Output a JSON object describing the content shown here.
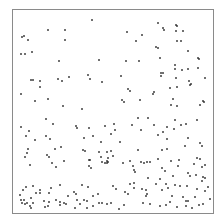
{
  "chart_data": {
    "type": "scatter",
    "title": "",
    "xlabel": "",
    "ylabel": "",
    "grid": false,
    "legend": null,
    "frame": {
      "left": 12,
      "top": 9,
      "right": 213,
      "bottom": 213
    },
    "point_color": "#222222",
    "point_size": 1.6,
    "coordinate_space": "pixel",
    "points": [
      [
        92,
        20
      ],
      [
        48,
        30
      ],
      [
        65,
        30
      ],
      [
        22,
        37
      ],
      [
        24,
        36
      ],
      [
        28,
        40
      ],
      [
        65,
        40
      ],
      [
        21,
        54
      ],
      [
        25,
        54
      ],
      [
        32,
        52
      ],
      [
        59,
        61
      ],
      [
        99,
        60
      ],
      [
        31,
        80
      ],
      [
        33,
        80
      ],
      [
        40,
        81
      ],
      [
        58,
        79
      ],
      [
        62,
        81
      ],
      [
        69,
        77
      ],
      [
        40,
        87
      ],
      [
        88,
        75
      ],
      [
        90,
        79
      ],
      [
        102,
        82
      ],
      [
        21,
        94
      ],
      [
        35,
        101
      ],
      [
        48,
        99
      ],
      [
        63,
        106
      ],
      [
        82,
        109
      ],
      [
        158,
        23
      ],
      [
        163,
        28
      ],
      [
        164,
        30
      ],
      [
        176,
        25
      ],
      [
        177,
        26
      ],
      [
        127,
        32
      ],
      [
        142,
        35
      ],
      [
        176,
        31
      ],
      [
        183,
        31
      ],
      [
        136,
        41
      ],
      [
        177,
        41
      ],
      [
        156,
        47
      ],
      [
        158,
        48
      ],
      [
        181,
        41
      ],
      [
        188,
        51
      ],
      [
        126,
        61
      ],
      [
        139,
        61
      ],
      [
        160,
        58
      ],
      [
        198,
        58
      ],
      [
        199,
        59
      ],
      [
        175,
        65
      ],
      [
        175,
        69
      ],
      [
        182,
        70
      ],
      [
        188,
        69
      ],
      [
        198,
        68
      ],
      [
        161,
        73
      ],
      [
        163,
        73
      ],
      [
        161,
        76
      ],
      [
        121,
        76
      ],
      [
        176,
        78
      ],
      [
        205,
        78
      ],
      [
        189,
        81
      ],
      [
        191,
        84
      ],
      [
        190,
        85
      ],
      [
        170,
        88
      ],
      [
        177,
        87
      ],
      [
        128,
        89
      ],
      [
        130,
        91
      ],
      [
        154,
        92
      ],
      [
        153,
        94
      ],
      [
        122,
        100
      ],
      [
        124,
        102
      ],
      [
        140,
        100
      ],
      [
        173,
        99
      ],
      [
        203,
        101
      ],
      [
        171,
        105
      ],
      [
        177,
        106
      ],
      [
        200,
        105
      ],
      [
        204,
        102
      ],
      [
        46,
        119
      ],
      [
        53,
        124
      ],
      [
        21,
        127
      ],
      [
        29,
        131
      ],
      [
        26,
        136
      ],
      [
        46,
        136
      ],
      [
        50,
        139
      ],
      [
        35,
        140
      ],
      [
        55,
        149
      ],
      [
        61,
        147
      ],
      [
        28,
        149
      ],
      [
        27,
        153
      ],
      [
        47,
        155
      ],
      [
        49,
        157
      ],
      [
        25,
        157
      ],
      [
        64,
        161
      ],
      [
        30,
        165
      ],
      [
        52,
        163
      ],
      [
        56,
        167
      ],
      [
        76,
        126
      ],
      [
        105,
        126
      ],
      [
        115,
        130
      ],
      [
        111,
        134
      ],
      [
        132,
        125
      ],
      [
        138,
        118
      ],
      [
        141,
        130
      ],
      [
        154,
        125
      ],
      [
        148,
        118
      ],
      [
        77,
        128
      ],
      [
        89,
        128
      ],
      [
        114,
        124
      ],
      [
        84,
        138
      ],
      [
        93,
        136
      ],
      [
        101,
        142
      ],
      [
        120,
        142
      ],
      [
        138,
        150
      ],
      [
        158,
        135
      ],
      [
        167,
        127
      ],
      [
        175,
        120
      ],
      [
        181,
        125
      ],
      [
        186,
        124
      ],
      [
        197,
        120
      ],
      [
        174,
        129
      ],
      [
        188,
        138
      ],
      [
        200,
        143
      ],
      [
        163,
        132
      ],
      [
        167,
        139
      ],
      [
        185,
        146
      ],
      [
        202,
        146
      ],
      [
        83,
        150
      ],
      [
        85,
        151
      ],
      [
        99,
        152
      ],
      [
        101,
        157
      ],
      [
        89,
        160
      ],
      [
        90,
        160
      ],
      [
        107,
        152
      ],
      [
        111,
        151
      ],
      [
        113,
        156
      ],
      [
        102,
        162
      ],
      [
        105,
        163
      ],
      [
        107,
        163
      ],
      [
        108,
        158
      ],
      [
        123,
        163
      ],
      [
        108,
        162
      ],
      [
        130,
        161
      ],
      [
        133,
        166
      ],
      [
        141,
        162
      ],
      [
        144,
        163
      ],
      [
        147,
        162
      ],
      [
        150,
        162
      ],
      [
        179,
        160
      ],
      [
        197,
        158
      ],
      [
        162,
        150
      ],
      [
        167,
        149
      ],
      [
        158,
        159
      ],
      [
        171,
        161
      ],
      [
        194,
        164
      ],
      [
        205,
        165
      ],
      [
        200,
        159
      ],
      [
        202,
        167
      ],
      [
        107,
        161
      ],
      [
        89,
        166
      ],
      [
        91,
        168
      ],
      [
        26,
        187
      ],
      [
        23,
        190
      ],
      [
        33,
        186
      ],
      [
        40,
        190
      ],
      [
        36,
        193
      ],
      [
        20,
        195
      ],
      [
        21,
        200
      ],
      [
        24,
        200
      ],
      [
        22,
        203
      ],
      [
        25,
        204
      ],
      [
        27,
        203
      ],
      [
        31,
        198
      ],
      [
        33,
        203
      ],
      [
        40,
        193
      ],
      [
        51,
        188
      ],
      [
        49,
        193
      ],
      [
        56,
        200
      ],
      [
        44,
        201
      ],
      [
        49,
        202
      ],
      [
        30,
        206
      ],
      [
        31,
        208
      ],
      [
        48,
        206
      ],
      [
        60,
        202
      ],
      [
        64,
        203
      ],
      [
        66,
        204
      ],
      [
        75,
        208
      ],
      [
        68,
        196
      ],
      [
        77,
        200
      ],
      [
        80,
        204
      ],
      [
        87,
        208
      ],
      [
        60,
        205
      ],
      [
        84,
        200
      ],
      [
        87,
        201
      ],
      [
        60,
        185
      ],
      [
        45,
        207
      ],
      [
        93,
        206
      ],
      [
        107,
        204
      ],
      [
        111,
        203
      ],
      [
        119,
        209
      ],
      [
        124,
        205
      ],
      [
        143,
        203
      ],
      [
        125,
        192
      ],
      [
        130,
        184
      ],
      [
        134,
        183
      ],
      [
        128,
        194
      ],
      [
        134,
        188
      ],
      [
        148,
        178
      ],
      [
        160,
        179
      ],
      [
        162,
        190
      ],
      [
        175,
        185
      ],
      [
        180,
        186
      ],
      [
        183,
        197
      ],
      [
        186,
        201
      ],
      [
        188,
        201
      ],
      [
        195,
        197
      ],
      [
        199,
        205
      ],
      [
        203,
        204
      ],
      [
        210,
        199
      ],
      [
        205,
        191
      ],
      [
        202,
        181
      ],
      [
        203,
        177
      ],
      [
        196,
        175
      ],
      [
        173,
        176
      ],
      [
        150,
        204
      ],
      [
        160,
        206
      ],
      [
        166,
        205
      ],
      [
        170,
        202
      ],
      [
        177,
        207
      ],
      [
        186,
        206
      ],
      [
        192,
        208
      ],
      [
        187,
        186
      ],
      [
        208,
        187
      ],
      [
        205,
        178
      ],
      [
        197,
        189
      ],
      [
        172,
        196
      ],
      [
        93,
        196
      ],
      [
        98,
        194
      ],
      [
        82,
        185
      ],
      [
        88,
        187
      ],
      [
        74,
        192
      ],
      [
        76,
        194
      ],
      [
        99,
        203
      ],
      [
        102,
        203
      ],
      [
        113,
        186
      ],
      [
        116,
        189
      ],
      [
        142,
        189
      ],
      [
        146,
        190
      ],
      [
        147,
        194
      ],
      [
        146,
        196
      ],
      [
        156,
        184
      ],
      [
        166,
        184
      ],
      [
        168,
        188
      ],
      [
        188,
        173
      ],
      [
        190,
        176
      ],
      [
        178,
        166
      ],
      [
        162,
        168
      ],
      [
        165,
        171
      ],
      [
        134,
        170
      ],
      [
        135,
        172
      ]
    ]
  }
}
